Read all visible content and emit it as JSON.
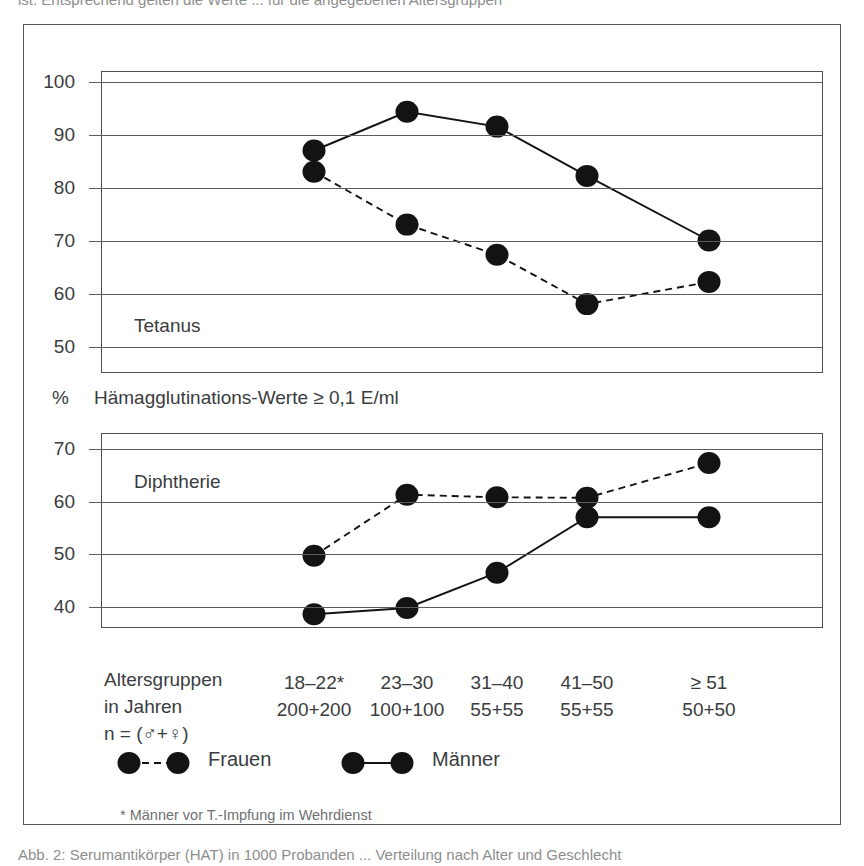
{
  "captions": {
    "top_cut": "ist. Entsprechend gelten die Werte  ...  für die angegebenen Altersgruppen",
    "bottom_cut": "Abb. 2:  Serumantikörper (HAT) in 1000 Probanden  ...  Verteilung nach Alter und Geschlecht"
  },
  "unit_axis": {
    "percent_symbol": "%",
    "caption": "Hämagglutinations-Werte ≥ 0,1 E/ml"
  },
  "xaxis": {
    "title_line1": "Altersgruppen",
    "title_line2": "in Jahren",
    "title_line3": "n = (♂+♀)",
    "groups": [
      {
        "range": "18–22*",
        "n": "200+200"
      },
      {
        "range": "23–30",
        "n": "100+100"
      },
      {
        "range": "31–40",
        "n": "55+55"
      },
      {
        "range": "41–50",
        "n": "55+55"
      },
      {
        "range": "≥ 51",
        "n": "50+50"
      }
    ]
  },
  "legend": {
    "frauen_label": "Frauen",
    "maenner_label": "Männer"
  },
  "footnote": "* Männer vor T.-Impfung im Wehrdienst",
  "chart_data": [
    {
      "type": "line",
      "title": "Tetanus",
      "xlabel": "Altersgruppen in Jahren",
      "ylabel": "% Hämagglutinations-Werte ≥ 0,1 E/ml",
      "categories": [
        "18–22*",
        "23–30",
        "31–40",
        "41–50",
        "≥ 51"
      ],
      "ylim": [
        45,
        102
      ],
      "yticks": [
        50,
        60,
        70,
        80,
        90,
        100
      ],
      "grid": true,
      "legend_position": "below-axis",
      "series": [
        {
          "name": "Männer",
          "style": "solid",
          "values": [
            87.0,
            94.3,
            91.5,
            82.2,
            70.0
          ]
        },
        {
          "name": "Frauen",
          "style": "dashed",
          "values": [
            83.0,
            73.0,
            67.3,
            58.0,
            62.2
          ]
        }
      ]
    },
    {
      "type": "line",
      "title": "Diphtherie",
      "xlabel": "Altersgruppen in Jahren",
      "ylabel": "% Hämagglutinations-Werte ≥ 0,1 E/ml",
      "categories": [
        "18–22*",
        "23–30",
        "31–40",
        "41–50",
        "≥ 51"
      ],
      "ylim": [
        36,
        73
      ],
      "yticks": [
        40,
        50,
        60,
        70
      ],
      "grid": true,
      "legend_position": "below-axis",
      "series": [
        {
          "name": "Männer",
          "style": "solid",
          "values": [
            38.6,
            39.8,
            46.5,
            57.0,
            57.0
          ]
        },
        {
          "name": "Frauen",
          "style": "dashed",
          "values": [
            49.7,
            61.3,
            60.8,
            60.7,
            67.3
          ]
        }
      ]
    }
  ],
  "colors": {
    "ink": "#131313",
    "frame": "#55585a",
    "text": "#3a3c3e"
  }
}
